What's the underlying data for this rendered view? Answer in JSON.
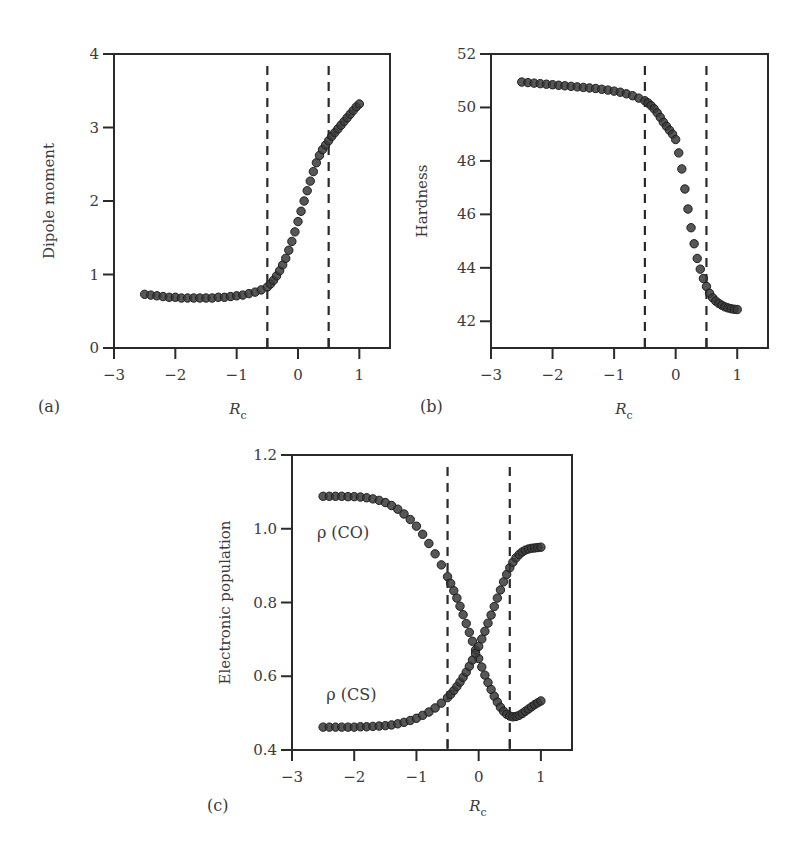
{
  "figure": {
    "background": "#ffffff",
    "axis_color": "#2a2a2a",
    "marker_color": "#3a3a3a",
    "marker_stroke": "#1e1e1e"
  },
  "chart_data": [
    {
      "type": "scatter",
      "panel_label": "(a)",
      "title": "",
      "xlabel": "R",
      "xlabel_sub": "c",
      "ylabel": "Dipole moment",
      "xlim": [
        -3,
        1.5
      ],
      "ylim": [
        0,
        4
      ],
      "xticks": [
        -3,
        -2,
        -1,
        0,
        1
      ],
      "xtick_labels": [
        "−3",
        "−2",
        "−1",
        "0",
        "1"
      ],
      "yticks": [
        0,
        1,
        2,
        3,
        4
      ],
      "ytick_labels": [
        "0",
        "1",
        "2",
        "3",
        "4"
      ],
      "vlines": [
        -0.5,
        0.5
      ],
      "vline_style": "dashed",
      "grid": false,
      "series": [
        {
          "name": "Dipole moment",
          "x": [
            -2.5,
            -2.4,
            -2.3,
            -2.2,
            -2.1,
            -2.0,
            -1.9,
            -1.8,
            -1.7,
            -1.6,
            -1.5,
            -1.4,
            -1.3,
            -1.2,
            -1.1,
            -1.0,
            -0.9,
            -0.8,
            -0.7,
            -0.6,
            -0.5,
            -0.45,
            -0.4,
            -0.35,
            -0.3,
            -0.25,
            -0.2,
            -0.15,
            -0.1,
            -0.05,
            0.0,
            0.05,
            0.1,
            0.15,
            0.2,
            0.25,
            0.3,
            0.35,
            0.4,
            0.45,
            0.5,
            0.55,
            0.6,
            0.65,
            0.7,
            0.75,
            0.8,
            0.85,
            0.9,
            0.95,
            1.0
          ],
          "y": [
            0.73,
            0.72,
            0.71,
            0.7,
            0.69,
            0.69,
            0.68,
            0.68,
            0.68,
            0.68,
            0.68,
            0.68,
            0.69,
            0.69,
            0.7,
            0.71,
            0.72,
            0.74,
            0.76,
            0.79,
            0.83,
            0.87,
            0.92,
            0.98,
            1.05,
            1.13,
            1.22,
            1.33,
            1.45,
            1.58,
            1.72,
            1.86,
            2.0,
            2.14,
            2.27,
            2.4,
            2.52,
            2.62,
            2.7,
            2.76,
            2.82,
            2.88,
            2.93,
            2.98,
            3.03,
            3.08,
            3.13,
            3.18,
            3.23,
            3.28,
            3.32
          ]
        }
      ]
    },
    {
      "type": "scatter",
      "panel_label": "(b)",
      "title": "",
      "xlabel": "R",
      "xlabel_sub": "c",
      "ylabel": "Hardness",
      "xlim": [
        -3,
        1.5
      ],
      "ylim": [
        41,
        52
      ],
      "xticks": [
        -3,
        -2,
        -1,
        0,
        1
      ],
      "xtick_labels": [
        "−3",
        "−2",
        "−1",
        "0",
        "1"
      ],
      "yticks": [
        42,
        44,
        46,
        48,
        50,
        52
      ],
      "ytick_labels": [
        "42",
        "44",
        "46",
        "48",
        "50",
        "52"
      ],
      "vlines": [
        -0.5,
        0.5
      ],
      "vline_style": "dashed",
      "grid": false,
      "series": [
        {
          "name": "Hardness",
          "x": [
            -2.5,
            -2.4,
            -2.3,
            -2.2,
            -2.1,
            -2.0,
            -1.9,
            -1.8,
            -1.7,
            -1.6,
            -1.5,
            -1.4,
            -1.3,
            -1.2,
            -1.1,
            -1.0,
            -0.9,
            -0.8,
            -0.7,
            -0.6,
            -0.5,
            -0.45,
            -0.4,
            -0.35,
            -0.3,
            -0.25,
            -0.2,
            -0.15,
            -0.1,
            -0.05,
            0.0,
            0.05,
            0.1,
            0.15,
            0.2,
            0.25,
            0.3,
            0.35,
            0.4,
            0.45,
            0.5,
            0.55,
            0.6,
            0.65,
            0.7,
            0.75,
            0.8,
            0.85,
            0.9,
            0.95,
            1.0
          ],
          "y": [
            50.95,
            50.93,
            50.91,
            50.89,
            50.87,
            50.85,
            50.83,
            50.81,
            50.79,
            50.77,
            50.75,
            50.73,
            50.71,
            50.68,
            50.65,
            50.61,
            50.57,
            50.51,
            50.44,
            50.35,
            50.25,
            50.17,
            50.07,
            49.95,
            49.8,
            49.63,
            49.45,
            49.3,
            49.15,
            49.0,
            48.8,
            48.3,
            47.7,
            46.95,
            46.2,
            45.5,
            44.9,
            44.35,
            43.95,
            43.6,
            43.3,
            43.05,
            42.88,
            42.76,
            42.67,
            42.6,
            42.54,
            42.5,
            42.47,
            42.45,
            42.44
          ]
        }
      ]
    },
    {
      "type": "scatter",
      "panel_label": "(c)",
      "title": "",
      "xlabel": "R",
      "xlabel_sub": "c",
      "ylabel": "Electronic population",
      "xlim": [
        -3,
        1.5
      ],
      "ylim": [
        0.4,
        1.2
      ],
      "xticks": [
        -3,
        -2,
        -1,
        0,
        1
      ],
      "xtick_labels": [
        "−3",
        "−2",
        "−1",
        "0",
        "1"
      ],
      "yticks": [
        0.4,
        0.6,
        0.8,
        1.0,
        1.2
      ],
      "ytick_labels": [
        "0.4",
        "0.6",
        "0.8",
        "1.0",
        "1.2"
      ],
      "vlines": [
        -0.5,
        0.5
      ],
      "vline_style": "dashed",
      "grid": false,
      "annotations": [
        {
          "text": "ρ (CO)",
          "x": -2.6,
          "y": 0.975
        },
        {
          "text": "ρ (CS)",
          "x": -2.45,
          "y": 0.535
        }
      ],
      "series": [
        {
          "name": "ρ (CO)",
          "x": [
            -2.5,
            -2.4,
            -2.3,
            -2.2,
            -2.1,
            -2.0,
            -1.9,
            -1.8,
            -1.7,
            -1.6,
            -1.5,
            -1.4,
            -1.3,
            -1.2,
            -1.1,
            -1.0,
            -0.9,
            -0.8,
            -0.7,
            -0.6,
            -0.5,
            -0.45,
            -0.4,
            -0.35,
            -0.3,
            -0.25,
            -0.2,
            -0.15,
            -0.1,
            -0.05,
            0.0,
            0.05,
            0.1,
            0.15,
            0.2,
            0.25,
            0.3,
            0.35,
            0.4,
            0.45,
            0.5,
            0.55,
            0.6,
            0.65,
            0.7,
            0.75,
            0.8,
            0.85,
            0.9,
            0.95,
            1.0
          ],
          "y": [
            1.088,
            1.088,
            1.088,
            1.088,
            1.087,
            1.087,
            1.086,
            1.084,
            1.081,
            1.077,
            1.071,
            1.063,
            1.053,
            1.04,
            1.025,
            1.007,
            0.985,
            0.96,
            0.932,
            0.902,
            0.87,
            0.852,
            0.832,
            0.812,
            0.79,
            0.767,
            0.743,
            0.719,
            0.695,
            0.671,
            0.648,
            0.625,
            0.603,
            0.583,
            0.564,
            0.546,
            0.53,
            0.516,
            0.505,
            0.497,
            0.492,
            0.49,
            0.491,
            0.494,
            0.499,
            0.505,
            0.511,
            0.517,
            0.523,
            0.528,
            0.533
          ]
        },
        {
          "name": "ρ (CS)",
          "x": [
            -2.5,
            -2.4,
            -2.3,
            -2.2,
            -2.1,
            -2.0,
            -1.9,
            -1.8,
            -1.7,
            -1.6,
            -1.5,
            -1.4,
            -1.3,
            -1.2,
            -1.1,
            -1.0,
            -0.9,
            -0.8,
            -0.7,
            -0.6,
            -0.5,
            -0.45,
            -0.4,
            -0.35,
            -0.3,
            -0.25,
            -0.2,
            -0.15,
            -0.1,
            -0.05,
            0.0,
            0.05,
            0.1,
            0.15,
            0.2,
            0.25,
            0.3,
            0.35,
            0.4,
            0.45,
            0.5,
            0.55,
            0.6,
            0.65,
            0.7,
            0.75,
            0.8,
            0.85,
            0.9,
            0.95,
            1.0
          ],
          "y": [
            0.462,
            0.462,
            0.462,
            0.462,
            0.462,
            0.462,
            0.463,
            0.463,
            0.464,
            0.465,
            0.466,
            0.468,
            0.471,
            0.475,
            0.48,
            0.486,
            0.494,
            0.503,
            0.514,
            0.527,
            0.542,
            0.551,
            0.561,
            0.572,
            0.584,
            0.597,
            0.611,
            0.627,
            0.644,
            0.662,
            0.681,
            0.701,
            0.722,
            0.744,
            0.766,
            0.789,
            0.812,
            0.834,
            0.856,
            0.876,
            0.894,
            0.909,
            0.921,
            0.93,
            0.937,
            0.942,
            0.945,
            0.947,
            0.948,
            0.949,
            0.95
          ]
        }
      ]
    }
  ]
}
